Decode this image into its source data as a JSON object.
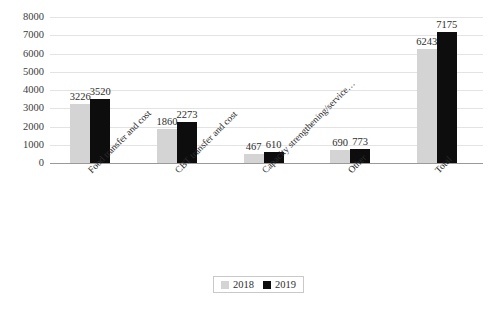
{
  "chart_data": {
    "type": "bar",
    "title": "",
    "subtitle": "",
    "xlabel": "",
    "ylabel": "",
    "ylim": [
      0,
      8000
    ],
    "ytick_step": 1000,
    "yticks": [
      "0",
      "1000",
      "2000",
      "3000",
      "4000",
      "5000",
      "6000",
      "7000",
      "8000"
    ],
    "grid": true,
    "legend_position": "bottom-center",
    "categories": [
      "Food transfer and cost",
      "CBT transfer and cost",
      "Capacity strengthening/service…",
      "Other",
      "Total"
    ],
    "series": [
      {
        "name": "2018",
        "color": "#d4d4d4",
        "values": [
          3226,
          1860,
          467,
          690,
          6243
        ]
      },
      {
        "name": "2019",
        "color": "#0d0d0d",
        "values": [
          3520,
          2273,
          610,
          773,
          7175
        ]
      }
    ]
  },
  "legend": {
    "items": [
      {
        "label": "2018",
        "color": "#d4d4d4"
      },
      {
        "label": "2019",
        "color": "#0d0d0d"
      }
    ]
  }
}
